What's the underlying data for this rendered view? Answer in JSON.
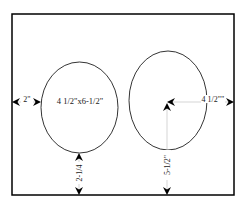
{
  "diagram": {
    "type": "layout-template",
    "frame": {
      "stroke": "#000000"
    },
    "ovals": [
      {
        "id": "left-oval",
        "label": "4 1/2\"x6-1/2\""
      },
      {
        "id": "right-oval",
        "label": ""
      }
    ],
    "dimensions": {
      "left_margin": "2\"",
      "bottom_margin_left": "2-1/4",
      "right_center_to_edge": "4 1/2\"\"",
      "right_center_to_bottom": "5-1/2\""
    },
    "colors": {
      "line": "#000000",
      "dim_line": "#bbbbbb",
      "arrow": "#000000"
    }
  }
}
